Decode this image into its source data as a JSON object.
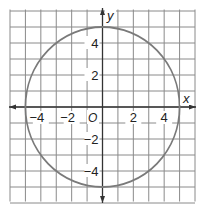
{
  "chart_data": {
    "type": "line",
    "title": "",
    "xlabel": "x",
    "ylabel": "y",
    "origin_label": "O",
    "xlim": [
      -6,
      6
    ],
    "ylim": [
      -6,
      6
    ],
    "grid": true,
    "grid_step": 1,
    "x_ticks": [
      {
        "value": -4,
        "label": "−4"
      },
      {
        "value": -2,
        "label": "−2"
      },
      {
        "value": 2,
        "label": "2"
      },
      {
        "value": 4,
        "label": "4"
      }
    ],
    "y_ticks": [
      {
        "value": 4,
        "label": "4"
      },
      {
        "value": 2,
        "label": "2"
      },
      {
        "value": -2,
        "label": "−2"
      },
      {
        "value": -4,
        "label": "−4"
      }
    ],
    "series": [
      {
        "name": "circle",
        "shape": "circle",
        "center": [
          0,
          0
        ],
        "radius": 5,
        "equation": "x^2 + y^2 = 25"
      }
    ],
    "colors": {
      "grid": "#8a8a8a",
      "axis": "#333333",
      "curve": "#7a7a7a"
    }
  }
}
